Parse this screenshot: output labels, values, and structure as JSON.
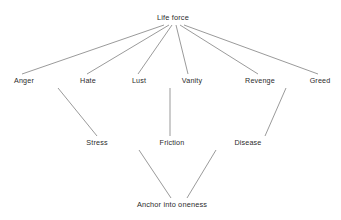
{
  "diagram": {
    "title": "Life force",
    "background_color": "#ffffff",
    "text_color": "#2b2b2b",
    "edge_color": "#6f6f6f",
    "nodes": [
      {
        "id": "life_force",
        "label": "Life force",
        "x": 173,
        "y": 18,
        "level": 0
      },
      {
        "id": "anger",
        "label": "Anger",
        "x": 24,
        "y": 81,
        "level": 1
      },
      {
        "id": "hate",
        "label": "Hate",
        "x": 88,
        "y": 81,
        "level": 1
      },
      {
        "id": "lust",
        "label": "Lust",
        "x": 139,
        "y": 81,
        "level": 1
      },
      {
        "id": "vanity",
        "label": "Vanity",
        "x": 192,
        "y": 81,
        "level": 1
      },
      {
        "id": "revenge",
        "label": "Revenge",
        "x": 260,
        "y": 81,
        "level": 1
      },
      {
        "id": "greed",
        "label": "Greed",
        "x": 320,
        "y": 81,
        "level": 1
      },
      {
        "id": "stress",
        "label": "Stress",
        "x": 97,
        "y": 143,
        "level": 2
      },
      {
        "id": "friction",
        "label": "Friction",
        "x": 172,
        "y": 143,
        "level": 2
      },
      {
        "id": "disease",
        "label": "Disease",
        "x": 248,
        "y": 143,
        "level": 2
      },
      {
        "id": "anchor",
        "label": "Anchor into oneness",
        "x": 172,
        "y": 205,
        "level": 3
      }
    ],
    "edges": [
      {
        "id": "life_force-anger",
        "from": "life_force",
        "to": "anger",
        "x1": 164,
        "y1": 25,
        "x2": 22,
        "y2": 74
      },
      {
        "id": "life_force-hate",
        "from": "life_force",
        "to": "hate",
        "x1": 169,
        "y1": 25,
        "x2": 87,
        "y2": 74
      },
      {
        "id": "life_force-lust",
        "from": "life_force",
        "to": "lust",
        "x1": 172,
        "y1": 25,
        "x2": 138,
        "y2": 74
      },
      {
        "id": "life_force-vanity",
        "from": "life_force",
        "to": "vanity",
        "x1": 176,
        "y1": 25,
        "x2": 188,
        "y2": 74
      },
      {
        "id": "life_force-revenge",
        "from": "life_force",
        "to": "revenge",
        "x1": 180,
        "y1": 25,
        "x2": 258,
        "y2": 74
      },
      {
        "id": "life_force-greed",
        "from": "life_force",
        "to": "greed",
        "x1": 184,
        "y1": 25,
        "x2": 318,
        "y2": 74
      },
      {
        "id": "hate-stress",
        "from": "hate",
        "to": "stress",
        "x1": 58,
        "y1": 88,
        "x2": 97,
        "y2": 136
      },
      {
        "id": "vanity-friction",
        "from": "vanity",
        "to": "friction",
        "x1": 170,
        "y1": 88,
        "x2": 170,
        "y2": 136
      },
      {
        "id": "greed-disease",
        "from": "greed",
        "to": "disease",
        "x1": 286,
        "y1": 88,
        "x2": 265,
        "y2": 136
      },
      {
        "id": "friction-anchor",
        "from": "friction",
        "to": "anchor",
        "x1": 139,
        "y1": 150,
        "x2": 171,
        "y2": 198
      },
      {
        "id": "disease-anchor",
        "from": "disease",
        "to": "anchor",
        "x1": 216,
        "y1": 150,
        "x2": 187,
        "y2": 198
      }
    ]
  }
}
